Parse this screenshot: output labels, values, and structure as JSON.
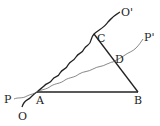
{
  "diagram": {
    "type": "geometry",
    "points": {
      "A": {
        "label": "A",
        "x": 37,
        "y": 92
      },
      "B": {
        "label": "B",
        "x": 138,
        "y": 92
      },
      "C": {
        "label": "C",
        "x": 94,
        "y": 34
      },
      "D": {
        "label": "D",
        "x": 113,
        "y": 62
      }
    },
    "curves": {
      "OO": {
        "start_label": "O",
        "end_label": "O'"
      },
      "PP": {
        "start_label": "P",
        "end_label": "P'"
      }
    },
    "segments": [
      "AB",
      "BC"
    ],
    "colors": {
      "stroke": "#222222",
      "thin_stroke": "#555555"
    }
  }
}
